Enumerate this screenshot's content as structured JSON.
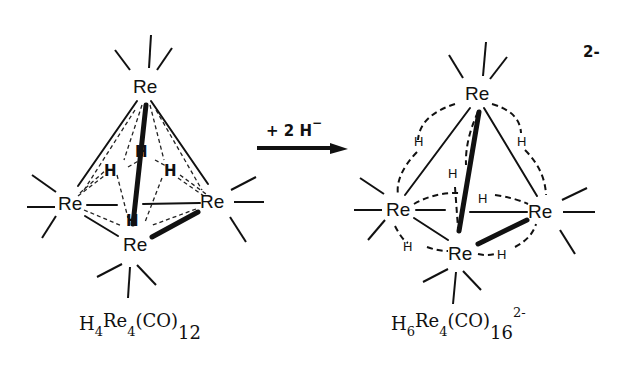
{
  "reaction": {
    "reagent_label": "+ 2 H",
    "reagent_charge": "−",
    "arrow": "right-arrow"
  },
  "reactant": {
    "metal_labels": [
      "Re",
      "Re",
      "Re",
      "Re"
    ],
    "hydride_labels": [
      "H",
      "H",
      "H",
      "H"
    ],
    "formula": {
      "H": "H",
      "H_count": "4",
      "Re": "Re",
      "Re_count": "4",
      "ligand": "(CO)",
      "ligand_count": "12"
    }
  },
  "product": {
    "charge_label": "2-",
    "metal_labels": [
      "Re",
      "Re",
      "Re",
      "Re"
    ],
    "hydride_labels": [
      "H",
      "H",
      "H",
      "H",
      "H",
      "H"
    ],
    "formula": {
      "H": "H",
      "H_count": "6",
      "Re": "Re",
      "Re_count": "4",
      "ligand": "(CO)",
      "ligand_count": "16",
      "charge": "2-"
    }
  }
}
